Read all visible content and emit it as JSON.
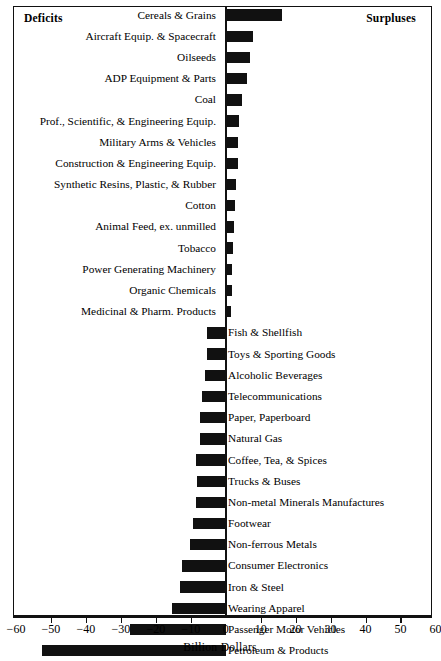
{
  "chart_data": {
    "type": "bar",
    "orientation": "horizontal",
    "title": "",
    "xlabel": "Billion Dollars",
    "ylabel": "",
    "xlim": [
      -60,
      60
    ],
    "xticks": [
      -60,
      -50,
      -40,
      -30,
      -20,
      -10,
      0,
      10,
      20,
      30,
      40,
      50,
      60
    ],
    "xticklabels": [
      "−60",
      "−50",
      "−40",
      "−30",
      "−20",
      "−10",
      "0",
      "10",
      "20",
      "30",
      "40",
      "50",
      "60"
    ],
    "grid": false,
    "legend": null,
    "annotations": [
      {
        "text": "Deficits",
        "position": "top-left"
      },
      {
        "text": "Surpluses",
        "position": "top-right"
      }
    ],
    "bar_color": "#111111",
    "categories": [
      "Cereals & Grains",
      "Aircraft Equip. & Spacecraft",
      "Oilseeds",
      "ADP Equipment & Parts",
      "Coal",
      "Prof., Scientific, & Engineering Equip.",
      "Military Arms & Vehicles",
      "Construction & Engineering Equip.",
      "Synthetic Resins, Plastic, & Rubber",
      "Cotton",
      "Animal Feed, ex. unmilled",
      "Tobacco",
      "Power Generating Machinery",
      "Organic Chemicals",
      "Medicinal & Pharm. Products",
      "Fish & Shellfish",
      "Toys & Sporting Goods",
      "Alcoholic Beverages",
      "Telecommunications",
      "Paper, Paperboard",
      "Natural Gas",
      "Coffee, Tea, & Spices",
      "Trucks & Buses",
      "Non-metal Minerals Manufactures",
      "Footwear",
      "Non-ferrous Metals",
      "Consumer Electronics",
      "Iron & Steel",
      "Wearing Apparel",
      "Passenger Motor Vehicles",
      "Petroleum & Products"
    ],
    "values": [
      16.1,
      7.9,
      7.0,
      6.0,
      4.7,
      3.8,
      3.6,
      3.4,
      3.0,
      2.7,
      2.4,
      2.2,
      1.9,
      1.7,
      1.4,
      -5.3,
      -5.4,
      -5.9,
      -6.7,
      -7.3,
      -7.3,
      -8.5,
      -8.3,
      -8.6,
      -9.4,
      -10.2,
      -12.4,
      -13.2,
      -15.4,
      -27.3,
      -52.5
    ]
  },
  "axis": {
    "title": "Billion Dollars"
  },
  "header": {
    "left_label": "Deficits",
    "right_label": "Surpluses"
  }
}
